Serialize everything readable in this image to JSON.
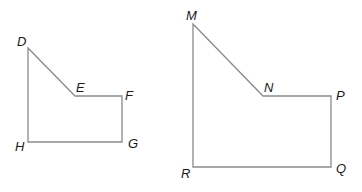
{
  "figures": [
    {
      "name": "small-polygon",
      "vertices": [
        {
          "label": "D",
          "x": 28,
          "y": 48,
          "lx": 17,
          "ly": 46
        },
        {
          "label": "E",
          "x": 75,
          "y": 96,
          "lx": 76,
          "ly": 92
        },
        {
          "label": "F",
          "x": 122,
          "y": 96,
          "lx": 125,
          "ly": 100
        },
        {
          "label": "G",
          "x": 122,
          "y": 142,
          "lx": 128,
          "ly": 148
        },
        {
          "label": "H",
          "x": 28,
          "y": 142,
          "lx": 15,
          "ly": 151
        }
      ]
    },
    {
      "name": "large-polygon",
      "vertices": [
        {
          "label": "M",
          "x": 193,
          "y": 24,
          "lx": 186,
          "ly": 20
        },
        {
          "label": "N",
          "x": 263,
          "y": 96,
          "lx": 264,
          "ly": 92
        },
        {
          "label": "P",
          "x": 331,
          "y": 96,
          "lx": 336,
          "ly": 100
        },
        {
          "label": "Q",
          "x": 331,
          "y": 167,
          "lx": 336,
          "ly": 173
        },
        {
          "label": "R",
          "x": 193,
          "y": 167,
          "lx": 181,
          "ly": 178
        }
      ]
    }
  ]
}
